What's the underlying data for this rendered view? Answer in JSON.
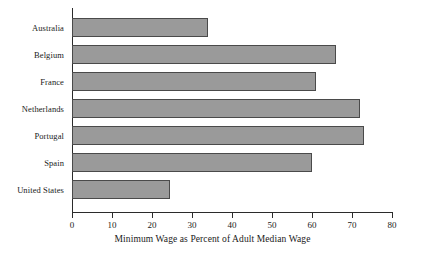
{
  "chart_data": {
    "type": "bar",
    "orientation": "horizontal",
    "title": "",
    "xlabel": "Minimum Wage as Percent of Adult Median Wage",
    "ylabel": "",
    "categories": [
      "Australia",
      "Belgium",
      "France",
      "Netherlands",
      "Portugal",
      "Spain",
      "United States"
    ],
    "values": [
      34,
      66,
      61,
      72,
      73,
      60,
      24.5
    ],
    "xlim": [
      0,
      80
    ],
    "xticks": [
      0,
      10,
      20,
      30,
      40,
      50,
      60,
      70,
      80
    ],
    "xtick_labels": [
      "0",
      "10",
      "20",
      "30",
      "40",
      "50",
      "60",
      "70",
      "80"
    ],
    "grid": false,
    "legend": false,
    "bar_color": "#9a9a9a",
    "bar_edge_color": "#4a4a4a",
    "axis_color": "#2b2b2b"
  }
}
